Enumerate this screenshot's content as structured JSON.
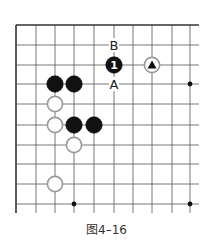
{
  "figure": {
    "caption": "图4–16",
    "board": {
      "columns_x": [
        16,
        36,
        55,
        74,
        94,
        114,
        133,
        152,
        172,
        190
      ],
      "rows_y": [
        25,
        45,
        65,
        84,
        104,
        125,
        145,
        164,
        184,
        204
      ],
      "extend_right_to": 199,
      "extend_bottom_to": 213,
      "edges": [
        "top",
        "left"
      ],
      "line_color": "#555555",
      "edge_color": "#333333",
      "star_points": [
        [
          9,
          3
        ],
        [
          3,
          9
        ],
        [
          9,
          9
        ]
      ]
    },
    "stones": [
      {
        "col": 5,
        "row": 2,
        "color": "black",
        "label": "1"
      },
      {
        "col": 7,
        "row": 2,
        "color": "white",
        "marker": "triangle"
      },
      {
        "col": 2,
        "row": 3,
        "color": "black"
      },
      {
        "col": 3,
        "row": 3,
        "color": "black"
      },
      {
        "col": 2,
        "row": 4,
        "color": "white"
      },
      {
        "col": 2,
        "row": 5,
        "color": "white"
      },
      {
        "col": 3,
        "row": 5,
        "color": "black"
      },
      {
        "col": 4,
        "row": 5,
        "color": "black"
      },
      {
        "col": 3,
        "row": 6,
        "color": "white"
      },
      {
        "col": 2,
        "row": 8,
        "color": "white"
      }
    ],
    "point_labels": [
      {
        "col": 5,
        "row": 1,
        "text": "B"
      },
      {
        "col": 5,
        "row": 3,
        "text": "A"
      }
    ]
  }
}
